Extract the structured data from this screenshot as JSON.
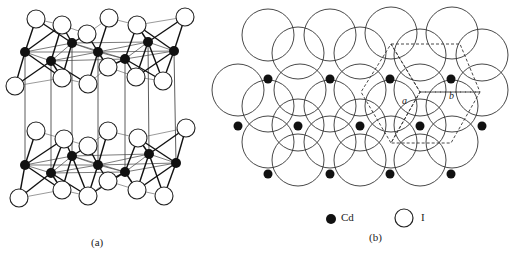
{
  "figure": {
    "panel_a": {
      "caption": "(a)",
      "description": "CdI2 layered structure side view: two layers of edge-sharing CdI6 octahedra",
      "cd_radius": 5,
      "i_radius": 9,
      "layers": [
        {
          "cd": [
            [
              25,
              52
            ],
            [
              51,
              61
            ],
            [
              72,
              43
            ],
            [
              98,
              52
            ],
            [
              125,
              59
            ],
            [
              148,
              42
            ],
            [
              174,
              51
            ]
          ],
          "i_top": [
            [
              36,
              19
            ],
            [
              62,
              25
            ],
            [
              87,
              34
            ],
            [
              109,
              18
            ],
            [
              137,
              25
            ],
            [
              185,
              17
            ]
          ],
          "i_bottom": [
            [
              15,
              86
            ],
            [
              62,
              78
            ],
            [
              88,
              84
            ],
            [
              108,
              67
            ],
            [
              136,
              77
            ],
            [
              163,
              81
            ]
          ]
        },
        {
          "cd": [
            [
              25,
              165
            ],
            [
              51,
              173
            ],
            [
              72,
              156
            ],
            [
              98,
              165
            ],
            [
              125,
              172
            ],
            [
              149,
              154
            ],
            [
              176,
              163
            ]
          ],
          "i_top": [
            [
              36,
              131
            ],
            [
              64,
              139
            ],
            [
              88,
              146
            ],
            [
              108,
              131
            ],
            [
              138,
              138
            ],
            [
              186,
              128
            ]
          ],
          "i_bottom": [
            [
              19,
              198
            ],
            [
              62,
              190
            ],
            [
              88,
              196
            ],
            [
              108,
              181
            ],
            [
              137,
              190
            ],
            [
              164,
              196
            ]
          ]
        }
      ],
      "interlayer_x": [
        25,
        51,
        72,
        98,
        125,
        148,
        174
      ]
    },
    "panel_b": {
      "caption": "(b)",
      "description": "Top view of CdI2 layer: close-packed I spheres with Cd in octahedral holes; dashed hexagonal unit cell",
      "i_radius": 26,
      "i_circles": [
        [
          268,
          35
        ],
        [
          330,
          35
        ],
        [
          391,
          33
        ],
        [
          452,
          33
        ],
        [
          298,
          53
        ],
        [
          360,
          53
        ],
        [
          420,
          55
        ],
        [
          482,
          55
        ],
        [
          238,
          90
        ],
        [
          300,
          90
        ],
        [
          360,
          90
        ],
        [
          420,
          90
        ],
        [
          482,
          90
        ],
        [
          268,
          106
        ],
        [
          330,
          106
        ],
        [
          391,
          106
        ],
        [
          452,
          106
        ],
        [
          298,
          125
        ],
        [
          360,
          125
        ],
        [
          420,
          125
        ],
        [
          268,
          142
        ],
        [
          330,
          142
        ],
        [
          391,
          142
        ],
        [
          452,
          142
        ],
        [
          298,
          160
        ],
        [
          360,
          160
        ],
        [
          420,
          160
        ]
      ],
      "cd_atoms": [
        [
          268,
          79
        ],
        [
          330,
          79
        ],
        [
          390,
          79
        ],
        [
          451,
          79
        ],
        [
          238,
          126
        ],
        [
          298,
          126
        ],
        [
          360,
          126
        ],
        [
          420,
          126
        ],
        [
          482,
          126
        ],
        [
          268,
          174
        ],
        [
          330,
          174
        ],
        [
          390,
          174
        ],
        [
          451,
          174
        ]
      ],
      "cell_a_label": "a",
      "cell_b_label": "b",
      "unit_cell_dashed": [
        [
          [
            391,
            44
          ],
          [
            460,
            44
          ],
          [
            480,
            92
          ],
          [
            420,
            92
          ],
          [
            391,
            44
          ]
        ],
        [
          [
            391,
            44
          ],
          [
            420,
            92
          ],
          [
            391,
            143
          ],
          [
            361,
            92
          ],
          [
            391,
            44
          ]
        ],
        [
          [
            420,
            92
          ],
          [
            480,
            92
          ],
          [
            451,
            143
          ],
          [
            391,
            143
          ],
          [
            420,
            92
          ]
        ]
      ]
    },
    "legend": {
      "items": [
        {
          "symbol": "filled-circle",
          "label": "Cd"
        },
        {
          "symbol": "open-circle",
          "label": "I"
        }
      ]
    }
  }
}
